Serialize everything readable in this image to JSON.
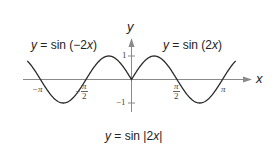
{
  "chart_data": {
    "type": "line",
    "title": "",
    "xlabel": "x",
    "ylabel": "y",
    "xlim": [
      -3.6,
      3.6
    ],
    "ylim": [
      -1,
      1
    ],
    "grid": false,
    "x_ticks": [
      "-π",
      "-π/2",
      "π/2",
      "π"
    ],
    "y_ticks": [
      "1",
      "-1"
    ],
    "series": [
      {
        "name": "y = sin |2x|",
        "function": "sin(|2x|)",
        "x_range": [
          -3.6,
          3.6
        ]
      }
    ],
    "annotations": [
      {
        "text": "y = sin (−2x)",
        "position": "upper-left",
        "refers_to": "x < 0 branch"
      },
      {
        "text": "y = sin (2x)",
        "position": "upper-right",
        "refers_to": "x > 0 branch"
      },
      {
        "text": "y = sin |2x|",
        "position": "bottom-center",
        "refers_to": "whole curve"
      }
    ]
  },
  "labels": {
    "left_eq": {
      "y": "y",
      "eq": " = sin (−2",
      "x": "x",
      "close": ")"
    },
    "right_eq": {
      "y": "y",
      "eq": " = sin (2",
      "x": "x",
      "close": ")"
    },
    "bottom_eq": {
      "y": "y",
      "eq": " = sin |2",
      "x": "x",
      "close": "|"
    },
    "x_axis": "x",
    "y_axis": "y",
    "tick_one": "1",
    "tick_neg_one": "−1",
    "tick_neg_pi": "−π",
    "tick_pi": "π",
    "tick_neg_half_pi_sign": "−",
    "tick_half_pi_num": "π",
    "tick_half_pi_den": "2",
    "tick_neg_half_pi_num": "π",
    "tick_neg_half_pi_den": "2"
  },
  "colors": {
    "curve": "#2a2a2a",
    "axis": "#8a8a8a"
  }
}
